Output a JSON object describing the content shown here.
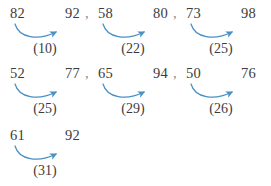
{
  "colors": {
    "background": "#ffffff",
    "text": "#3c3c3c",
    "arrow": "#4a90c2",
    "separator": "#8a8a8a"
  },
  "separator": ",",
  "rows": [
    {
      "groups": [
        {
          "start": "82",
          "end": "92",
          "delta": "(10)"
        },
        {
          "start": "58",
          "end": "80",
          "delta": "(22)"
        },
        {
          "start": "73",
          "end": "98",
          "delta": "(25)"
        }
      ]
    },
    {
      "groups": [
        {
          "start": "52",
          "end": "77",
          "delta": "(25)"
        },
        {
          "start": "65",
          "end": "94",
          "delta": "(29)"
        },
        {
          "start": "50",
          "end": "76",
          "delta": "(26)"
        }
      ]
    },
    {
      "groups": [
        {
          "start": "61",
          "end": "92",
          "delta": "(31)"
        }
      ]
    }
  ]
}
